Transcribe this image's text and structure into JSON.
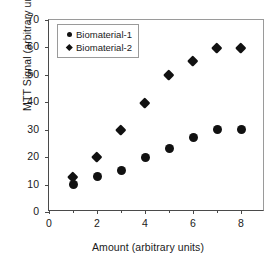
{
  "chart_data": {
    "type": "scatter",
    "title": "",
    "xlabel": "Amount (arbitrary units)",
    "ylabel": "MTT Signal (arbitrary units)",
    "xlim": [
      0,
      9
    ],
    "ylim": [
      0,
      70
    ],
    "xticks": [
      0,
      2,
      4,
      6,
      8
    ],
    "xticks_minor": [
      1,
      3,
      5,
      7
    ],
    "yticks": [
      0,
      10,
      20,
      30,
      40,
      50,
      60,
      70
    ],
    "grid": false,
    "legend_position": "upper left",
    "marker_color": "#111111",
    "axis_color": "#4a4a4a",
    "frame_color": "#9a9a9a",
    "x": [
      1,
      2,
      3,
      4,
      5,
      6,
      7,
      8
    ],
    "series": [
      {
        "name": "Biomaterial-1",
        "marker": "circle",
        "values": [
          10,
          13,
          15,
          20,
          23,
          27,
          30,
          30
        ]
      },
      {
        "name": "Biomaterial-2",
        "marker": "diamond",
        "values": [
          13,
          20,
          30,
          40,
          50,
          55,
          60,
          60
        ]
      }
    ]
  }
}
